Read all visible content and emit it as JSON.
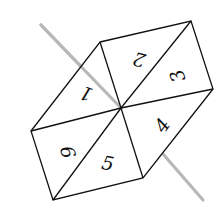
{
  "diagram": {
    "colors": {
      "edge": "#111111",
      "axis": "#b8b8b8",
      "background": "#ffffff"
    },
    "triangles": [
      {
        "label": "1",
        "rotation": 200
      },
      {
        "label": "2",
        "rotation": 195
      },
      {
        "label": "3",
        "rotation": 250
      },
      {
        "label": "4",
        "rotation": -55
      },
      {
        "label": "5",
        "rotation": 10
      },
      {
        "label": "6",
        "rotation": 75
      }
    ]
  }
}
